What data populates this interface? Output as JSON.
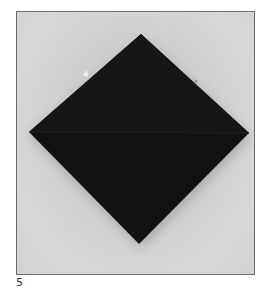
{
  "figure": {
    "step_number": "5",
    "colors": {
      "background_paper": "#d0d0d0",
      "folded_paper": "#141414",
      "fold_crease": "#1e1e1e",
      "frame_border": "#6b6b6b"
    }
  }
}
